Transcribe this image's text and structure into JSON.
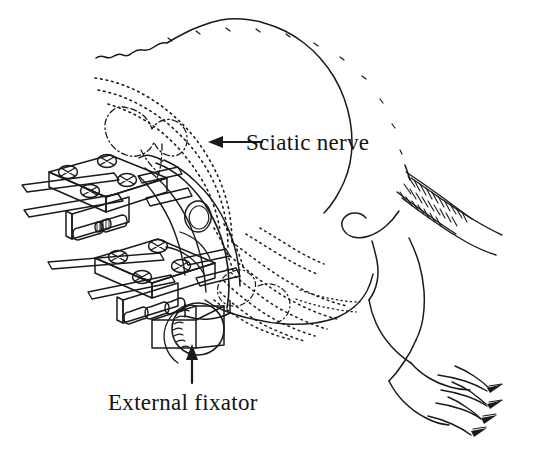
{
  "figure": {
    "background_color": "#ffffff",
    "ink_color": "#1a1a1a",
    "width": 557,
    "height": 459
  },
  "annotations": [
    {
      "id": "sciatic-nerve",
      "label": "Sciatic nerve",
      "arrow_direction": "left",
      "text_x": 246,
      "text_y": 150,
      "arrow_from_x": 262,
      "arrow_from_y": 142,
      "arrow_to_x": 210,
      "arrow_to_y": 142
    },
    {
      "id": "external-fixator",
      "label": "External fixator",
      "arrow_direction": "up",
      "text_x": 108,
      "text_y": 410,
      "arrow_from_x": 192,
      "arrow_from_y": 383,
      "arrow_to_x": 192,
      "arrow_to_y": 345
    }
  ],
  "anatomy": {
    "body_outline": "rat hindquarters, dorsal contour drawn as wavy hair line",
    "tail": "tapering tail with hatched base",
    "hind_paw": "paw with four toes and claws",
    "pelvis_bone": "dash-dot outline of pelvis and femoral head",
    "femur_bone": "solid outline of femur with oval foramen",
    "nerve_rendering": "dotted lines branching distally"
  },
  "device": {
    "name": "External fixator",
    "plates": 2,
    "screws_per_plate": 4,
    "screw_style": "cross-slot round head",
    "pins": 4,
    "knob": "knurled cylindrical adjustment knob",
    "connector_block": "rectangular clamp body"
  }
}
